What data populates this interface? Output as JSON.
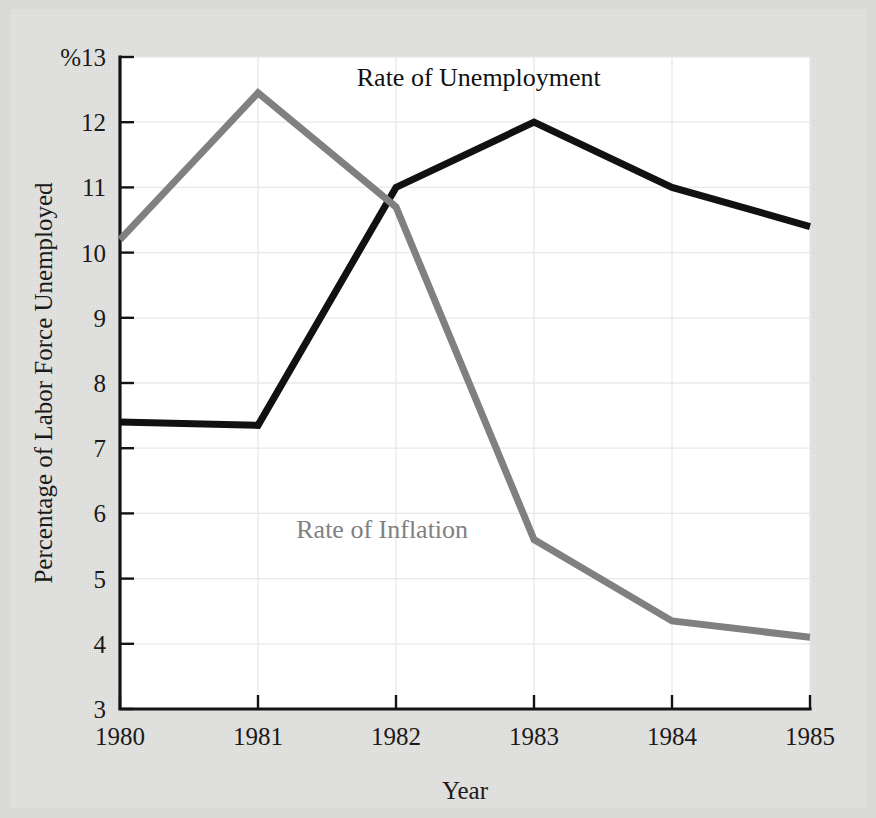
{
  "chart_data": {
    "type": "line",
    "title": "",
    "xlabel": "Year",
    "ylabel": "Percentage of Labor Force Unemployed",
    "x": [
      "1980",
      "1981",
      "1982",
      "1983",
      "1984",
      "1985"
    ],
    "xlim": [
      1980,
      1985
    ],
    "ylim": [
      3,
      13
    ],
    "yticks": [
      3,
      4,
      5,
      6,
      7,
      8,
      9,
      10,
      11,
      12,
      13
    ],
    "ytick_labels": [
      "3",
      "4",
      "5",
      "6",
      "7",
      "8",
      "9",
      "10",
      "11",
      "12",
      "%13"
    ],
    "y_unit_symbol": "%",
    "grid": "horizontal-and-vertical-light",
    "legend": "inline-annotations",
    "series": [
      {
        "name": "Rate of Unemployment",
        "color": "#111111",
        "stroke_width": 7,
        "values": [
          7.4,
          7.35,
          11.0,
          12.0,
          11.0,
          10.4
        ],
        "label_x": "1982.6",
        "label_y": "12.55"
      },
      {
        "name": "Rate of Inflation",
        "color": "#808080",
        "stroke_width": 7,
        "values": [
          10.2,
          12.45,
          10.7,
          5.6,
          4.35,
          4.1
        ],
        "label_x": "1981.9",
        "label_y": "5.62"
      }
    ]
  },
  "figure": {
    "background_color": "#e4e4e2",
    "plot_background_color": "#ffffff",
    "axis_color": "#141414",
    "gridline_color": "#e8e8e8"
  }
}
